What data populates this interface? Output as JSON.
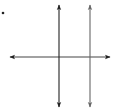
{
  "diagram": {
    "colors": {
      "background": "#ffffff",
      "transversal": "#333333",
      "line_left": "#222222",
      "line_right": "#666666",
      "dot": "#222222"
    },
    "lines": [
      {
        "id": "transversal",
        "orientation": "horizontal",
        "x1": 9,
        "y1": 57,
        "x2": 111,
        "y2": 57,
        "arrows": "both"
      },
      {
        "id": "line-left",
        "orientation": "vertical",
        "x1": 59,
        "y1": 4,
        "x2": 59,
        "y2": 108,
        "arrows": "both"
      },
      {
        "id": "line-right",
        "orientation": "vertical",
        "x1": 90,
        "y1": 4,
        "x2": 90,
        "y2": 108,
        "arrows": "both"
      }
    ],
    "dot": {
      "x": 3,
      "y": 13
    }
  }
}
